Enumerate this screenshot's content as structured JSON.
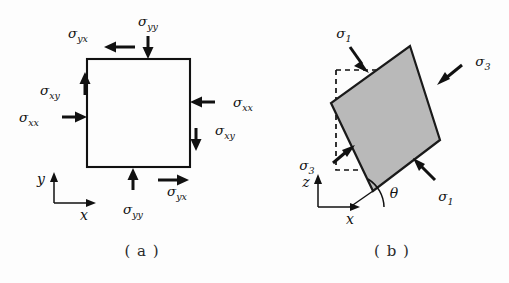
{
  "figure": {
    "background_color": "#fdfdfd",
    "ink_color": "#111111",
    "block_fill_color": "#b9b9b9"
  },
  "panels": [
    {
      "id": "a",
      "caption": "( a )",
      "description": "Stress components on an unrotated square element",
      "axes": {
        "horizontal_label": "x",
        "vertical_label": "y"
      },
      "stress_labels": [
        {
          "name": "top-shear",
          "sigma": "σ",
          "subscript": "yx",
          "arrow_direction": "left"
        },
        {
          "name": "top-normal",
          "sigma": "σ",
          "subscript": "yy",
          "arrow_direction": "down"
        },
        {
          "name": "left-shear",
          "sigma": "σ",
          "subscript": "xy",
          "arrow_direction": "up"
        },
        {
          "name": "left-normal",
          "sigma": "σ",
          "subscript": "xx",
          "arrow_direction": "right"
        },
        {
          "name": "right-normal",
          "sigma": "σ",
          "subscript": "xx",
          "arrow_direction": "left"
        },
        {
          "name": "right-shear",
          "sigma": "σ",
          "subscript": "xy",
          "arrow_direction": "down"
        },
        {
          "name": "bottom-normal",
          "sigma": "σ",
          "subscript": "yy",
          "arrow_direction": "up"
        },
        {
          "name": "bottom-shear",
          "sigma": "σ",
          "subscript": "yx",
          "arrow_direction": "right"
        }
      ]
    },
    {
      "id": "b",
      "caption": "( b )",
      "description": "Principal stresses on a square element rotated by angle theta",
      "axes": {
        "horizontal_label": "x",
        "vertical_label": "z",
        "angle_label": "θ",
        "angle_degrees": 28
      },
      "stress_labels": [
        {
          "name": "upper-left-principal",
          "sigma": "σ",
          "subscript": "1",
          "arrow_direction": "down-right"
        },
        {
          "name": "upper-right-principal",
          "sigma": "σ",
          "subscript": "3",
          "arrow_direction": "down-left"
        },
        {
          "name": "lower-left-principal",
          "sigma": "σ",
          "subscript": "3",
          "arrow_direction": "up-right"
        },
        {
          "name": "lower-right-principal",
          "sigma": "σ",
          "subscript": "1",
          "arrow_direction": "up-left"
        }
      ]
    }
  ]
}
